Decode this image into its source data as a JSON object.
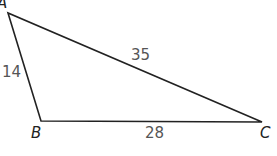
{
  "diagram": {
    "type": "triangle",
    "vertices": [
      {
        "name": "A",
        "x": 8,
        "y": 13
      },
      {
        "name": "B",
        "x": 41,
        "y": 121
      },
      {
        "name": "C",
        "x": 262,
        "y": 122
      }
    ],
    "sides": [
      {
        "between": "AB",
        "length": "14"
      },
      {
        "between": "AC",
        "length": "35"
      },
      {
        "between": "BC",
        "length": "28"
      }
    ],
    "stroke_color": "#222222",
    "label_color": "#555555"
  }
}
